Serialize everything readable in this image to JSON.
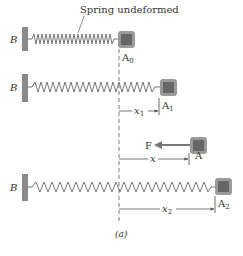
{
  "figure": {
    "caption": "(a)",
    "annotation": "Spring undeformed",
    "colors": {
      "wall": "#8a8a8a",
      "spring": "#777777",
      "block_outer": "#9a9a9a",
      "block_inner": "#666666",
      "dashed_line": "#555555",
      "arrow": "#666666",
      "text": "#333333"
    }
  },
  "rows": [
    {
      "wall_label": "B",
      "position_label": "A",
      "position_sub": "0",
      "displacement": null
    },
    {
      "wall_label": "B",
      "position_label": "A",
      "position_sub": "1",
      "displacement_label": "x",
      "displacement_sub": "1"
    },
    {
      "position_label": "A",
      "force_label": "F",
      "displacement_label": "x"
    },
    {
      "wall_label": "B",
      "position_label": "A",
      "position_sub": "2",
      "displacement_label": "x",
      "displacement_sub": "2"
    }
  ]
}
